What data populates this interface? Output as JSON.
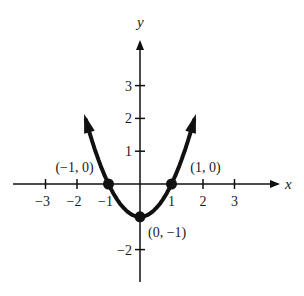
{
  "chart_data": {
    "type": "line",
    "title": "",
    "function": "y = x^2 - 1",
    "xlabel": "x",
    "ylabel": "y",
    "xlim": [
      -3.9,
      4.2
    ],
    "ylim": [
      -3.2,
      4.4
    ],
    "grid": false,
    "x_ticks": [
      -3,
      -2,
      -1,
      1,
      2,
      3
    ],
    "x_tick_labels": [
      "−3",
      "−2",
      "−1",
      "1",
      "2",
      "3"
    ],
    "y_ticks": [
      3,
      2,
      1,
      -2
    ],
    "y_tick_labels": [
      "3",
      "2",
      "1",
      "−2"
    ],
    "series": [
      {
        "name": "parabola",
        "x": [
          -1.75,
          -1.5,
          -1.25,
          -1,
          -0.75,
          -0.5,
          -0.25,
          0,
          0.25,
          0.5,
          0.75,
          1,
          1.25,
          1.5,
          1.75
        ],
        "y": [
          2.06,
          1.25,
          0.56,
          0,
          -0.44,
          -0.75,
          -0.94,
          -1,
          -0.94,
          -0.75,
          -0.44,
          0,
          0.56,
          1.25,
          2.06
        ],
        "arrows_at_ends": true
      }
    ],
    "highlighted_points": [
      {
        "x": -1,
        "y": 0,
        "label": "(−1, 0)"
      },
      {
        "x": 1,
        "y": 0,
        "label": "(1, 0)"
      },
      {
        "x": 0,
        "y": -1,
        "label": "(0, −1)"
      }
    ],
    "colors": {
      "line": "#111111",
      "axis": "#111111",
      "background": "#ffffff"
    }
  }
}
